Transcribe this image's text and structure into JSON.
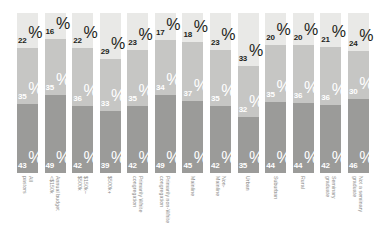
{
  "chart_data": {
    "type": "bar",
    "subtype": "100-percent-stacked-column",
    "title": "",
    "subtitle": "",
    "xlabel": "",
    "ylabel": "",
    "ylim": [
      0,
      100
    ],
    "grid": false,
    "legend_position": "none",
    "orientation": "vertical",
    "stack_order_top_to_bottom": [
      "lightest",
      "light",
      "medium",
      "dark"
    ],
    "categories": [
      "All pastors",
      "Annual budget <$150k",
      "$150k–$500k",
      "$500k+",
      "Primarily White congregation",
      "Primarily non-White congregation",
      "Mainline",
      "Non-Mainline",
      "Urban",
      "Suburban",
      "Rural",
      "Seminary graduate",
      "Not a seminary graduate"
    ],
    "series": [
      {
        "name": "lightest",
        "color": "#e9e9e7",
        "label_color": "#231f20",
        "values": [
          22,
          16,
          22,
          29,
          23,
          17,
          18,
          23,
          33,
          20,
          20,
          21,
          24
        ]
      },
      {
        "name": "medium",
        "color": "#c6c6c4",
        "label_color": "#ffffff",
        "values": [
          35,
          35,
          36,
          33,
          35,
          34,
          37,
          35,
          32,
          35,
          36,
          36,
          30
        ]
      },
      {
        "name": "dark",
        "color": "#9b9b99",
        "label_color": "#ffffff",
        "values": [
          43,
          49,
          42,
          39,
          42,
          49,
          45,
          42,
          35,
          44,
          44,
          42,
          46
        ]
      }
    ],
    "value_suffix": "%",
    "bars": [
      {
        "category": "All pastors",
        "category_lines": [
          "All pastors"
        ],
        "segments": [
          {
            "series": "lightest",
            "value": 22,
            "label": "22",
            "suffix": "%"
          },
          {
            "series": "medium",
            "value": 35,
            "label": "35",
            "suffix": "%"
          },
          {
            "series": "dark",
            "value": 43,
            "label": "43",
            "suffix": "%"
          }
        ]
      },
      {
        "category": "Annual budget <$150k",
        "category_lines": [
          "Annual budget",
          "<$150k"
        ],
        "segments": [
          {
            "series": "lightest",
            "value": 16,
            "label": "16",
            "suffix": "%"
          },
          {
            "series": "medium",
            "value": 35,
            "label": "35",
            "suffix": "%"
          },
          {
            "series": "dark",
            "value": 49,
            "label": "49",
            "suffix": "%"
          }
        ]
      },
      {
        "category": "$150k–$500k",
        "category_lines": [
          "$150k–$500k"
        ],
        "segments": [
          {
            "series": "lightest",
            "value": 22,
            "label": "22",
            "suffix": "%"
          },
          {
            "series": "medium",
            "value": 36,
            "label": "36",
            "suffix": "%"
          },
          {
            "series": "dark",
            "value": 42,
            "label": "42",
            "suffix": "%"
          }
        ]
      },
      {
        "category": "$500k+",
        "category_lines": [
          "$500k+"
        ],
        "segments": [
          {
            "series": "lightest",
            "value": 29,
            "label": "29",
            "suffix": "%"
          },
          {
            "series": "medium",
            "value": 33,
            "label": "33",
            "suffix": "%"
          },
          {
            "series": "dark",
            "value": 39,
            "label": "39",
            "suffix": "%"
          }
        ]
      },
      {
        "category": "Primarily White congregation",
        "category_lines": [
          "Primarily White",
          "congregation"
        ],
        "segments": [
          {
            "series": "lightest",
            "value": 23,
            "label": "23",
            "suffix": "%"
          },
          {
            "series": "medium",
            "value": 35,
            "label": "35",
            "suffix": "%"
          },
          {
            "series": "dark",
            "value": 42,
            "label": "42",
            "suffix": "%"
          }
        ]
      },
      {
        "category": "Primarily non-White congregation",
        "category_lines": [
          "Primarily non-White",
          "congregation"
        ],
        "segments": [
          {
            "series": "lightest",
            "value": 17,
            "label": "17",
            "suffix": "%"
          },
          {
            "series": "medium",
            "value": 34,
            "label": "34",
            "suffix": "%"
          },
          {
            "series": "dark",
            "value": 49,
            "label": "49",
            "suffix": "%"
          }
        ]
      },
      {
        "category": "Mainline",
        "category_lines": [
          "Mainline"
        ],
        "segments": [
          {
            "series": "lightest",
            "value": 18,
            "label": "18",
            "suffix": "%"
          },
          {
            "series": "medium",
            "value": 37,
            "label": "37",
            "suffix": "%"
          },
          {
            "series": "dark",
            "value": 45,
            "label": "45",
            "suffix": "%"
          }
        ]
      },
      {
        "category": "Non-Mainline",
        "category_lines": [
          "Non-Mainline"
        ],
        "segments": [
          {
            "series": "lightest",
            "value": 23,
            "label": "23",
            "suffix": "%"
          },
          {
            "series": "medium",
            "value": 35,
            "label": "35",
            "suffix": "%"
          },
          {
            "series": "dark",
            "value": 42,
            "label": "42",
            "suffix": "%"
          }
        ]
      },
      {
        "category": "Urban",
        "category_lines": [
          "Urban"
        ],
        "segments": [
          {
            "series": "lightest",
            "value": 33,
            "label": "33",
            "suffix": "%"
          },
          {
            "series": "medium",
            "value": 32,
            "label": "32",
            "suffix": "%"
          },
          {
            "series": "dark",
            "value": 35,
            "label": "35",
            "suffix": "%"
          }
        ]
      },
      {
        "category": "Suburban",
        "category_lines": [
          "Suburban"
        ],
        "segments": [
          {
            "series": "lightest",
            "value": 20,
            "label": "20",
            "suffix": "%"
          },
          {
            "series": "medium",
            "value": 35,
            "label": "35",
            "suffix": "%"
          },
          {
            "series": "dark",
            "value": 44,
            "label": "44",
            "suffix": "%"
          }
        ]
      },
      {
        "category": "Rural",
        "category_lines": [
          "Rural"
        ],
        "segments": [
          {
            "series": "lightest",
            "value": 20,
            "label": "20",
            "suffix": "%"
          },
          {
            "series": "medium",
            "value": 36,
            "label": "36",
            "suffix": "%"
          },
          {
            "series": "dark",
            "value": 44,
            "label": "44",
            "suffix": "%"
          }
        ]
      },
      {
        "category": "Seminary graduate",
        "category_lines": [
          "Seminary",
          "graduate"
        ],
        "segments": [
          {
            "series": "lightest",
            "value": 21,
            "label": "21",
            "suffix": "%"
          },
          {
            "series": "medium",
            "value": 36,
            "label": "36",
            "suffix": "%"
          },
          {
            "series": "dark",
            "value": 42,
            "label": "42",
            "suffix": "%"
          }
        ]
      },
      {
        "category": "Not a seminary graduate",
        "category_lines": [
          "Not a seminary",
          "graduate"
        ],
        "segments": [
          {
            "series": "lightest",
            "value": 24,
            "label": "24",
            "suffix": "%"
          },
          {
            "series": "medium",
            "value": 30,
            "label": "30",
            "suffix": "%"
          },
          {
            "series": "dark",
            "value": 46,
            "label": "46",
            "suffix": "%"
          }
        ]
      }
    ]
  }
}
